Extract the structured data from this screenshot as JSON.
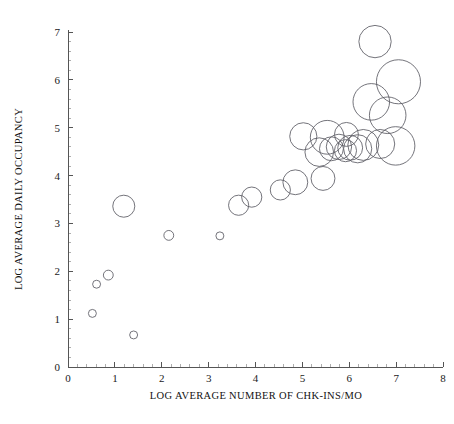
{
  "chart_data": {
    "type": "scatter",
    "variant": "bubble",
    "title": "",
    "subtitle": "",
    "xlabel": "LOG AVERAGE NUMBER OF CHK-INS/MO",
    "ylabel": "LOG AVERAGE DAILY OCCUPANCY",
    "xlim": [
      0,
      8
    ],
    "ylim": [
      0,
      7
    ],
    "xticks": [
      0,
      1,
      2,
      3,
      4,
      5,
      6,
      7,
      8
    ],
    "yticks": [
      0,
      1,
      2,
      3,
      4,
      5,
      6,
      7
    ],
    "xtick_labels": [
      "0",
      "1",
      "2",
      "3",
      "4",
      "5",
      "6",
      "7",
      "8"
    ],
    "ytick_labels": [
      "0",
      "1",
      "2",
      "3",
      "4",
      "5",
      "6",
      "7"
    ],
    "x_minor_ticks_per_interval": 5,
    "y_minor_ticks_per_interval": 5,
    "grid": false,
    "legend": null,
    "legend_position": "none",
    "marker_style": "open-circle",
    "marker_stroke_color": "#5b5b63",
    "marker_fill": "none",
    "axis_color": "#555555",
    "background_color": "#ffffff",
    "size_encoding": "bubble area encodes a third variable (unlabeled)",
    "n_points": 28,
    "points": [
      {
        "x": 0.52,
        "y": 1.12,
        "r": 0.085
      },
      {
        "x": 0.61,
        "y": 1.73,
        "r": 0.085
      },
      {
        "x": 0.86,
        "y": 1.92,
        "r": 0.105
      },
      {
        "x": 1.4,
        "y": 0.67,
        "r": 0.085
      },
      {
        "x": 1.19,
        "y": 3.36,
        "r": 0.235
      },
      {
        "x": 2.15,
        "y": 2.75,
        "r": 0.105
      },
      {
        "x": 3.24,
        "y": 2.74,
        "r": 0.085
      },
      {
        "x": 3.64,
        "y": 3.38,
        "r": 0.215
      },
      {
        "x": 3.92,
        "y": 3.55,
        "r": 0.215
      },
      {
        "x": 4.53,
        "y": 3.7,
        "r": 0.215
      },
      {
        "x": 4.85,
        "y": 3.86,
        "r": 0.265
      },
      {
        "x": 5.44,
        "y": 3.94,
        "r": 0.255
      },
      {
        "x": 5.02,
        "y": 4.82,
        "r": 0.29
      },
      {
        "x": 5.53,
        "y": 4.8,
        "r": 0.36
      },
      {
        "x": 5.36,
        "y": 4.49,
        "r": 0.305
      },
      {
        "x": 5.62,
        "y": 4.56,
        "r": 0.255
      },
      {
        "x": 5.78,
        "y": 4.6,
        "r": 0.27
      },
      {
        "x": 5.92,
        "y": 4.52,
        "r": 0.235
      },
      {
        "x": 6.02,
        "y": 4.58,
        "r": 0.265
      },
      {
        "x": 6.18,
        "y": 4.56,
        "r": 0.3
      },
      {
        "x": 6.3,
        "y": 4.64,
        "r": 0.33
      },
      {
        "x": 5.94,
        "y": 4.86,
        "r": 0.255
      },
      {
        "x": 6.55,
        "y": 6.8,
        "r": 0.345
      },
      {
        "x": 7.05,
        "y": 5.96,
        "r": 0.47
      },
      {
        "x": 6.47,
        "y": 5.54,
        "r": 0.39
      },
      {
        "x": 6.82,
        "y": 5.26,
        "r": 0.39
      },
      {
        "x": 6.66,
        "y": 4.66,
        "r": 0.31
      },
      {
        "x": 6.99,
        "y": 4.62,
        "r": 0.41
      }
    ]
  },
  "figure": {
    "caption": "",
    "note": ""
  }
}
